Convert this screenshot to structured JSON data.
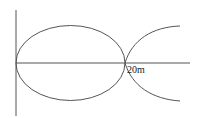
{
  "diagram": {
    "label": "20m",
    "stroke_color": "#555555",
    "background": "#ffffff"
  }
}
